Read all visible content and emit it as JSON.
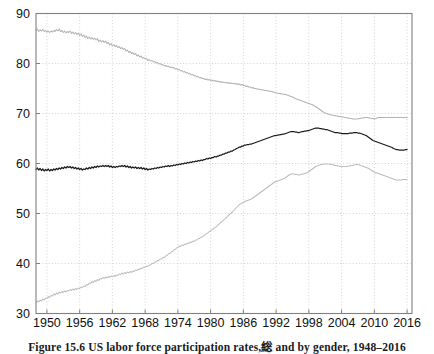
{
  "figure": {
    "caption": "Figure 15.6 US labor force participation rates,総 and by gender, 1948–2016"
  },
  "chart_data": {
    "type": "line",
    "title": "",
    "xlabel": "",
    "ylabel": "",
    "xlim": [
      1948,
      2016.9
    ],
    "ylim": [
      30,
      90
    ],
    "yticks": [
      30,
      40,
      50,
      60,
      70,
      80,
      90
    ],
    "xticks": [
      1950,
      1956,
      1962,
      1968,
      1974,
      1980,
      1986,
      1992,
      1998,
      2004,
      2010,
      2016
    ],
    "grid": "dotted-both",
    "legend": "none",
    "colors": {
      "total": "#1a1a1a",
      "men": "#b3b3b3",
      "women": "#bdbdbd",
      "axis": "#808080",
      "gridline": "#c8c8c8"
    },
    "x_step_years": 0.25,
    "series": [
      {
        "name": "Men",
        "color": "#b3b3b3",
        "x_start": 1948,
        "values": [
          86.6,
          86.9,
          86.4,
          86.7,
          86.5,
          86.8,
          86.4,
          86.6,
          86.3,
          86.5,
          86.2,
          86.5,
          86.3,
          86.6,
          86.4,
          86.8,
          86.5,
          86.9,
          86.4,
          86.6,
          86.2,
          86.5,
          86.1,
          86.4,
          86.2,
          86.5,
          86.0,
          86.3,
          85.9,
          86.2,
          85.8,
          86.1,
          85.6,
          85.9,
          85.4,
          85.7,
          85.2,
          85.5,
          85.0,
          85.3,
          84.9,
          85.2,
          84.8,
          85.1,
          84.7,
          85.0,
          84.4,
          84.7,
          84.3,
          84.6,
          84.2,
          84.5,
          84.0,
          84.2,
          83.7,
          84.0,
          83.5,
          83.8,
          83.4,
          83.6,
          83.2,
          83.4,
          83.0,
          83.2,
          82.8,
          83.0,
          82.5,
          82.7,
          82.2,
          82.4,
          82.0,
          82.2,
          81.8,
          82.0,
          81.5,
          81.7,
          81.3,
          81.5,
          81.1,
          81.2,
          80.9,
          81.0,
          80.6,
          80.8,
          80.5,
          80.6,
          80.3,
          80.4,
          80.1,
          80.2,
          79.9,
          80.0,
          79.7,
          79.8,
          79.5,
          79.6,
          79.4,
          79.5,
          79.2,
          79.3,
          79.1,
          79.2,
          78.9,
          79.0,
          78.7,
          78.8,
          78.5,
          78.6,
          78.3,
          78.4,
          78.1,
          78.2,
          77.9,
          78.0,
          77.7,
          77.8,
          77.5,
          77.6,
          77.3,
          77.4,
          77.1,
          77.2,
          77.0,
          77.0,
          76.8,
          76.9,
          76.7,
          76.8,
          76.6,
          76.7,
          76.5,
          76.6,
          76.4,
          76.5,
          76.3,
          76.4,
          76.2,
          76.3,
          76.2,
          76.2,
          76.1,
          76.2,
          76.0,
          76.1,
          76.0,
          76.0,
          75.9,
          76.0,
          75.8,
          75.9,
          75.7,
          75.8,
          75.6,
          75.6,
          75.4,
          75.5,
          75.3,
          75.3,
          75.1,
          75.2,
          75.0,
          75.0,
          74.9,
          74.9,
          74.8,
          74.8,
          74.7,
          74.7,
          74.6,
          74.6,
          74.5,
          74.5,
          74.4,
          74.4,
          74.3,
          74.2,
          74.1,
          74.1,
          74.0,
          74.0,
          73.9,
          73.9,
          73.8,
          73.8,
          73.7,
          73.6,
          73.5,
          73.4,
          73.3,
          73.2,
          73.0,
          72.9,
          72.8,
          72.7,
          72.6,
          72.5,
          72.4,
          72.3,
          72.2,
          72.1,
          72.0,
          71.9,
          71.8,
          71.7,
          71.5,
          71.4,
          71.2,
          71.0,
          70.8,
          70.6,
          70.4,
          70.2,
          70.1,
          70.0,
          69.9,
          69.8,
          69.7,
          69.7,
          69.6,
          69.6,
          69.5,
          69.5,
          69.4,
          69.4,
          69.3,
          69.3,
          69.2,
          69.2,
          69.1,
          69.1,
          69.0,
          69.0,
          68.9,
          68.9,
          68.9,
          68.9,
          68.9,
          69.0,
          69.0,
          69.1,
          69.1,
          69.2,
          69.2,
          69.2,
          69.1,
          69.1,
          69.0,
          69.0,
          68.9,
          69.0,
          69.1,
          69.2,
          69.2,
          69.2,
          69.2,
          69.2,
          69.2,
          69.2,
          69.2,
          69.2,
          69.2,
          69.2,
          69.2,
          69.2,
          69.2,
          69.2,
          69.2,
          69.2,
          69.2,
          69.2,
          69.2,
          69.2,
          69.2
        ]
      },
      {
        "name": "Total",
        "color": "#1a1a1a",
        "x_start": 1948,
        "values": [
          58.8,
          59.1,
          58.7,
          59.0,
          58.6,
          58.9,
          58.5,
          58.8,
          58.6,
          58.9,
          58.5,
          58.8,
          58.6,
          58.9,
          58.7,
          59.0,
          58.8,
          59.1,
          58.9,
          59.2,
          59.0,
          59.3,
          59.1,
          59.4,
          59.2,
          59.4,
          59.1,
          59.3,
          59.0,
          59.2,
          58.9,
          59.1,
          58.8,
          59.0,
          58.7,
          58.9,
          58.8,
          59.1,
          58.9,
          59.2,
          59.0,
          59.3,
          59.1,
          59.4,
          59.2,
          59.5,
          59.3,
          59.5,
          59.4,
          59.6,
          59.4,
          59.6,
          59.4,
          59.6,
          59.3,
          59.5,
          59.2,
          59.4,
          59.2,
          59.4,
          59.3,
          59.5,
          59.4,
          59.6,
          59.4,
          59.6,
          59.3,
          59.5,
          59.2,
          59.4,
          59.1,
          59.3,
          59.1,
          59.3,
          59.0,
          59.2,
          59.0,
          59.2,
          58.9,
          59.1,
          58.8,
          59.0,
          58.7,
          58.9,
          58.8,
          59.0,
          58.9,
          59.1,
          59.0,
          59.2,
          59.1,
          59.3,
          59.2,
          59.4,
          59.3,
          59.5,
          59.4,
          59.6,
          59.4,
          59.6,
          59.5,
          59.7,
          59.6,
          59.8,
          59.7,
          59.9,
          59.8,
          60.0,
          59.9,
          60.1,
          60.0,
          60.2,
          60.1,
          60.3,
          60.2,
          60.4,
          60.3,
          60.5,
          60.4,
          60.6,
          60.5,
          60.7,
          60.6,
          60.8,
          60.8,
          61.0,
          60.9,
          61.1,
          61.0,
          61.2,
          61.2,
          61.4,
          61.3,
          61.5,
          61.5,
          61.7,
          61.7,
          61.9,
          61.9,
          62.1,
          62.1,
          62.3,
          62.3,
          62.5,
          62.5,
          62.7,
          62.8,
          63.0,
          63.1,
          63.3,
          63.3,
          63.5,
          63.5,
          63.7,
          63.7,
          63.8,
          63.8,
          63.9,
          63.9,
          64.0,
          64.1,
          64.2,
          64.3,
          64.4,
          64.5,
          64.6,
          64.7,
          64.8,
          64.9,
          65.0,
          65.1,
          65.2,
          65.3,
          65.4,
          65.5,
          65.6,
          65.6,
          65.7,
          65.7,
          65.8,
          65.8,
          65.9,
          65.9,
          66.0,
          66.1,
          66.2,
          66.3,
          66.4,
          66.4,
          66.4,
          66.3,
          66.3,
          66.2,
          66.2,
          66.3,
          66.4,
          66.4,
          66.5,
          66.5,
          66.6,
          66.6,
          66.7,
          66.8,
          66.9,
          67.0,
          67.1,
          67.1,
          67.1,
          67.0,
          67.0,
          66.9,
          66.9,
          66.8,
          66.8,
          66.7,
          66.6,
          66.5,
          66.4,
          66.3,
          66.2,
          66.2,
          66.2,
          66.1,
          66.1,
          66.0,
          66.0,
          66.0,
          66.0,
          66.0,
          66.0,
          66.1,
          66.1,
          66.1,
          66.2,
          66.2,
          66.2,
          66.1,
          66.1,
          66.0,
          65.9,
          65.8,
          65.7,
          65.6,
          65.4,
          65.2,
          65.0,
          64.8,
          64.6,
          64.5,
          64.4,
          64.3,
          64.2,
          64.1,
          64.0,
          63.9,
          63.8,
          63.7,
          63.6,
          63.5,
          63.4,
          63.3,
          63.2,
          63.0,
          62.9,
          62.8,
          62.8,
          62.7,
          62.7,
          62.7,
          62.7,
          62.7,
          62.8,
          62.8
        ]
      },
      {
        "name": "Women",
        "color": "#bdbdbd",
        "x_start": 1948,
        "values": [
          32.2,
          32.5,
          32.3,
          32.7,
          32.5,
          32.9,
          32.7,
          33.1,
          33.0,
          33.4,
          33.2,
          33.6,
          33.5,
          33.9,
          33.7,
          34.1,
          33.9,
          34.3,
          34.1,
          34.4,
          34.2,
          34.5,
          34.3,
          34.6,
          34.5,
          34.8,
          34.6,
          34.9,
          34.7,
          35.0,
          34.8,
          35.1,
          35.0,
          35.3,
          35.2,
          35.5,
          35.4,
          35.8,
          35.7,
          36.1,
          36.0,
          36.4,
          36.2,
          36.6,
          36.4,
          36.8,
          36.6,
          37.0,
          36.9,
          37.2,
          37.0,
          37.3,
          37.1,
          37.4,
          37.2,
          37.5,
          37.3,
          37.6,
          37.4,
          37.7,
          37.6,
          37.9,
          37.8,
          38.1,
          37.9,
          38.2,
          38.0,
          38.3,
          38.1,
          38.4,
          38.2,
          38.5,
          38.4,
          38.7,
          38.6,
          38.9,
          38.8,
          39.1,
          39.0,
          39.3,
          39.2,
          39.5,
          39.4,
          39.7,
          39.7,
          40.0,
          40.0,
          40.3,
          40.3,
          40.6,
          40.6,
          40.9,
          40.9,
          41.2,
          41.2,
          41.5,
          41.6,
          41.9,
          42.0,
          42.3,
          42.4,
          42.7,
          42.8,
          43.1,
          43.2,
          43.5,
          43.4,
          43.7,
          43.6,
          43.9,
          43.8,
          44.1,
          44.0,
          44.3,
          44.2,
          44.5,
          44.4,
          44.7,
          44.7,
          45.0,
          45.0,
          45.3,
          45.3,
          45.6,
          45.7,
          46.0,
          46.1,
          46.4,
          46.5,
          46.8,
          46.9,
          47.2,
          47.3,
          47.6,
          47.8,
          48.1,
          48.3,
          48.6,
          48.8,
          49.1,
          49.3,
          49.6,
          49.8,
          50.1,
          50.3,
          50.6,
          50.9,
          51.2,
          51.5,
          51.8,
          51.9,
          52.1,
          52.2,
          52.4,
          52.5,
          52.6,
          52.7,
          52.8,
          52.9,
          53.1,
          53.3,
          53.5,
          53.7,
          53.9,
          54.1,
          54.3,
          54.5,
          54.7,
          54.9,
          55.1,
          55.3,
          55.5,
          55.7,
          55.9,
          56.1,
          56.3,
          56.4,
          56.5,
          56.6,
          56.7,
          56.8,
          56.9,
          57.0,
          57.2,
          57.4,
          57.6,
          57.8,
          57.9,
          57.9,
          57.9,
          57.8,
          57.8,
          57.7,
          57.7,
          57.8,
          57.9,
          57.9,
          58.0,
          58.1,
          58.2,
          58.4,
          58.6,
          58.8,
          59.0,
          59.2,
          59.4,
          59.5,
          59.6,
          59.7,
          59.8,
          59.8,
          59.9,
          59.9,
          59.9,
          59.9,
          59.9,
          59.8,
          59.8,
          59.7,
          59.6,
          59.6,
          59.5,
          59.5,
          59.4,
          59.4,
          59.4,
          59.4,
          59.4,
          59.4,
          59.5,
          59.5,
          59.6,
          59.6,
          59.7,
          59.7,
          59.8,
          59.8,
          59.7,
          59.6,
          59.5,
          59.4,
          59.3,
          59.2,
          59.1,
          59.0,
          58.8,
          58.6,
          58.4,
          58.3,
          58.2,
          58.1,
          58.0,
          57.9,
          57.8,
          57.7,
          57.6,
          57.5,
          57.4,
          57.3,
          57.2,
          57.1,
          57.0,
          56.9,
          56.8,
          56.7,
          56.7,
          56.7,
          56.7,
          56.7,
          56.8,
          56.8,
          56.8,
          56.8
        ]
      }
    ]
  }
}
